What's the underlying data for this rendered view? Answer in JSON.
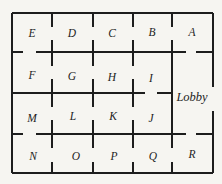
{
  "figure": {
    "type": "floor-plan",
    "background_color": "#f6f5f1",
    "wall_color": "#1d1d1d",
    "label_color": "#1d1d1d",
    "wall_thickness": 2,
    "label_font_size": 11.5,
    "lobby_font_size": 12.5,
    "rooms": [
      {
        "name": "E",
        "label_x": 32,
        "label_y": 33
      },
      {
        "name": "D",
        "label_x": 72,
        "label_y": 33
      },
      {
        "name": "C",
        "label_x": 112,
        "label_y": 33
      },
      {
        "name": "B",
        "label_x": 152,
        "label_y": 32
      },
      {
        "name": "A",
        "label_x": 192,
        "label_y": 32
      },
      {
        "name": "F",
        "label_x": 32,
        "label_y": 75
      },
      {
        "name": "G",
        "label_x": 72,
        "label_y": 76
      },
      {
        "name": "H",
        "label_x": 112,
        "label_y": 77
      },
      {
        "name": "I",
        "label_x": 151,
        "label_y": 78
      },
      {
        "name": "Lobby",
        "label_x": 192,
        "label_y": 97
      },
      {
        "name": "M",
        "label_x": 32,
        "label_y": 118
      },
      {
        "name": "L",
        "label_x": 73,
        "label_y": 116
      },
      {
        "name": "K",
        "label_x": 113,
        "label_y": 116
      },
      {
        "name": "J",
        "label_x": 151,
        "label_y": 118
      },
      {
        "name": "N",
        "label_x": 33,
        "label_y": 156
      },
      {
        "name": "O",
        "label_x": 76,
        "label_y": 156
      },
      {
        "name": "P",
        "label_x": 114,
        "label_y": 156
      },
      {
        "name": "Q",
        "label_x": 153,
        "label_y": 156
      },
      {
        "name": "R",
        "label_x": 192,
        "label_y": 154
      }
    ],
    "walls": [
      [
        12,
        13,
        213,
        13
      ],
      [
        12,
        173,
        213,
        173
      ],
      [
        12,
        13,
        12,
        173
      ],
      [
        213,
        13,
        213,
        87
      ],
      [
        213,
        111,
        213,
        173
      ],
      [
        12,
        52,
        23,
        52
      ],
      [
        36,
        52,
        186,
        52
      ],
      [
        196,
        52,
        213,
        52
      ],
      [
        12,
        93,
        145,
        93
      ],
      [
        157,
        93,
        172,
        93
      ],
      [
        12,
        134,
        23,
        134
      ],
      [
        36,
        134,
        186,
        134
      ],
      [
        196,
        134,
        213,
        134
      ],
      [
        52,
        13,
        52,
        27
      ],
      [
        52,
        40,
        52,
        52
      ],
      [
        93,
        13,
        93,
        27
      ],
      [
        93,
        40,
        93,
        52
      ],
      [
        133,
        13,
        133,
        27
      ],
      [
        133,
        40,
        133,
        52
      ],
      [
        172,
        13,
        172,
        27
      ],
      [
        172,
        40,
        172,
        52
      ],
      [
        52,
        52,
        52,
        66
      ],
      [
        52,
        79,
        52,
        93
      ],
      [
        93,
        52,
        93,
        66
      ],
      [
        93,
        79,
        93,
        93
      ],
      [
        133,
        52,
        133,
        66
      ],
      [
        133,
        79,
        133,
        93
      ],
      [
        172,
        52,
        172,
        134
      ],
      [
        52,
        93,
        52,
        107
      ],
      [
        52,
        120,
        52,
        134
      ],
      [
        93,
        93,
        93,
        107
      ],
      [
        93,
        120,
        93,
        134
      ],
      [
        133,
        93,
        133,
        107
      ],
      [
        133,
        120,
        133,
        134
      ],
      [
        52,
        134,
        52,
        148
      ],
      [
        52,
        162,
        52,
        173
      ],
      [
        93,
        134,
        93,
        148
      ],
      [
        93,
        162,
        93,
        173
      ],
      [
        133,
        134,
        133,
        148
      ],
      [
        133,
        162,
        133,
        173
      ],
      [
        172,
        134,
        172,
        148
      ],
      [
        172,
        162,
        172,
        173
      ]
    ]
  }
}
